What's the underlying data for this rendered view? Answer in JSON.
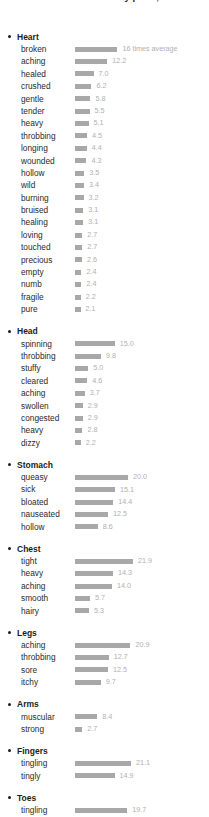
{
  "header": {
    "title": "our most emotional body parts, an"
  },
  "chart_data": {
    "type": "bar",
    "title": "our most emotional body parts",
    "xlabel": "",
    "ylabel": "",
    "unit_annotation": "16 times average",
    "value_suffix": "",
    "bar_color": "#a8a8a8",
    "value_color": "#b0b0b0",
    "grid": false,
    "legend_position": "none",
    "xlim": [
      0,
      22
    ],
    "scale_px_per_unit": 2.65,
    "bar_origin_px": 75,
    "groups": [
      {
        "name": "Heart",
        "categories": [
          "broken",
          "aching",
          "healed",
          "crushed",
          "gentle",
          "tender",
          "heavy",
          "throbbing",
          "longing",
          "wounded",
          "hollow",
          "wild",
          "burning",
          "bruised",
          "healing",
          "loving",
          "touched",
          "precious",
          "empty",
          "numb",
          "fragile",
          "pure"
        ],
        "values": [
          16.0,
          12.2,
          7.0,
          6.2,
          5.8,
          5.5,
          5.1,
          4.5,
          4.4,
          4.3,
          3.5,
          3.4,
          3.2,
          3.1,
          3.1,
          2.7,
          2.7,
          2.6,
          2.4,
          2.4,
          2.2,
          2.1
        ],
        "labels": [
          "16 times average",
          "12.2",
          "7.0",
          "6.2",
          "5.8",
          "5.5",
          "5.1",
          "4.5",
          "4.4",
          "4.3",
          "3.5",
          "3.4",
          "3.2",
          "3.1",
          "3.1",
          "2.7",
          "2.7",
          "2.6",
          "2.4",
          "2.4",
          "2.2",
          "2.1"
        ]
      },
      {
        "name": "Head",
        "categories": [
          "spinning",
          "throbbing",
          "stuffy",
          "cleared",
          "aching",
          "swollen",
          "congested",
          "heavy",
          "dizzy"
        ],
        "values": [
          15.0,
          9.8,
          5.0,
          4.6,
          3.7,
          2.9,
          2.9,
          2.8,
          2.2
        ],
        "labels": [
          "15.0",
          "9.8",
          "5.0",
          "4.6",
          "3.7",
          "2.9",
          "2.9",
          "2.8",
          "2.2"
        ]
      },
      {
        "name": "Stomach",
        "categories": [
          "queasy",
          "sick",
          "bloated",
          "nauseated",
          "hollow"
        ],
        "values": [
          20.0,
          15.1,
          14.4,
          12.5,
          8.6
        ],
        "labels": [
          "20.0",
          "15.1",
          "14.4",
          "12.5",
          "8.6"
        ]
      },
      {
        "name": "Chest",
        "categories": [
          "tight",
          "heavy",
          "aching",
          "smooth",
          "hairy"
        ],
        "values": [
          21.9,
          14.3,
          14.0,
          5.7,
          5.3
        ],
        "labels": [
          "21.9",
          "14.3",
          "14.0",
          "5.7",
          "5.3"
        ]
      },
      {
        "name": "Legs",
        "categories": [
          "aching",
          "throbbing",
          "sore",
          "itchy"
        ],
        "values": [
          20.9,
          12.7,
          12.5,
          9.7
        ],
        "labels": [
          "20.9",
          "12.7",
          "12.5",
          "9.7"
        ]
      },
      {
        "name": "Arms",
        "categories": [
          "muscular",
          "strong"
        ],
        "values": [
          8.4,
          2.7
        ],
        "labels": [
          "8.4",
          "2.7"
        ]
      },
      {
        "name": "Fingers",
        "categories": [
          "tingling",
          "tingly"
        ],
        "values": [
          21.1,
          14.9
        ],
        "labels": [
          "21.1",
          "14.9"
        ]
      },
      {
        "name": "Toes",
        "categories": [
          "tingling"
        ],
        "values": [
          19.7
        ],
        "labels": [
          "19.7"
        ]
      }
    ]
  }
}
